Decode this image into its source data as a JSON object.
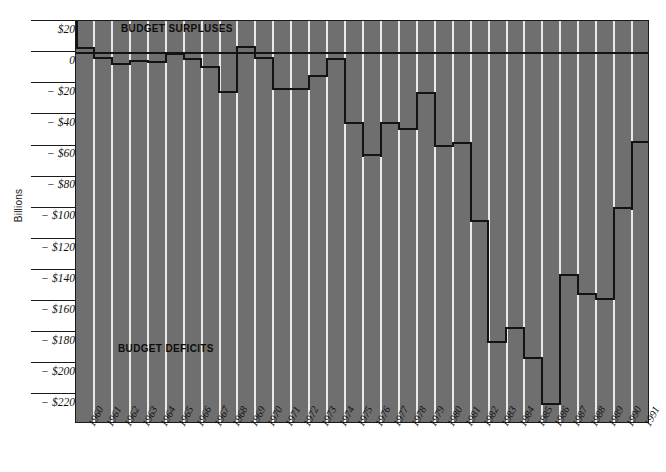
{
  "chart_data": {
    "type": "area",
    "title": "",
    "xlabel": "",
    "ylabel": "Billions",
    "ylim": [
      -230,
      28
    ],
    "ytick_values": [
      20,
      0,
      -20,
      -40,
      -60,
      -80,
      -100,
      -120,
      -140,
      -160,
      -180,
      -200,
      -220
    ],
    "ytick_labels": [
      "$20",
      "0",
      "− $20",
      "− $40",
      "− $60",
      "− $80",
      "− $100",
      "− $120",
      "− $140",
      "− $160",
      "− $180",
      "− $200",
      "− $220"
    ],
    "categories": [
      "1960",
      "1961",
      "1962",
      "1963",
      "1964",
      "1965",
      "1966",
      "1967",
      "1968",
      "1969",
      "1970",
      "1971",
      "1972",
      "1973",
      "1974",
      "1975",
      "1976",
      "1977",
      "1978",
      "1979",
      "1980",
      "1981",
      "1982",
      "1983",
      "1984",
      "1985",
      "1986",
      "1987",
      "1988",
      "1989",
      "1990",
      "1991"
    ],
    "values": [
      3,
      -3,
      -7,
      -5,
      -6,
      -1,
      -4,
      -9,
      -25,
      3,
      -3,
      -23,
      -23,
      -15,
      -6,
      -53,
      -74,
      -54,
      -59,
      -40,
      -74,
      -79,
      -128,
      -208,
      -185,
      -212,
      -221,
      -150,
      -155,
      -153,
      -221,
      -270
    ],
    "step_levels_billions": [
      3,
      -3,
      -7,
      -5,
      -6,
      -1,
      -4,
      -9,
      -25,
      4,
      -3,
      -23,
      -23,
      -15,
      -4,
      -45,
      -66,
      -45,
      -49,
      -26,
      -60,
      -58,
      -108,
      -186,
      -177,
      -196,
      -226,
      -143,
      -155,
      -158,
      -100,
      -57
    ],
    "grid": false,
    "legend_position": "none",
    "annotations": [
      {
        "text": "BUDGET SURPLUSES",
        "region": "top"
      },
      {
        "text": "BUDGET DEFICITS",
        "region": "lower-left"
      }
    ],
    "colors": {
      "plot_background": "#6f6f6f",
      "gridline": "#e9e9e9",
      "line": "#131313",
      "page_background": "#ffffff"
    }
  }
}
